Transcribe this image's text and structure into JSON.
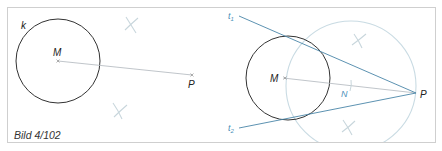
{
  "figure": {
    "caption": "Bild 4/102",
    "colors": {
      "frame": "#cfcfcf",
      "circle": "#333333",
      "helper_line": "#b9bec4",
      "tangent": "#4a86a8",
      "thales_circle": "#c9dbe3",
      "construction_marks": "#c8d6dc",
      "label": "#222222",
      "blue_label": "#4a90b8"
    },
    "left_panel": {
      "circle_label": "k",
      "center_label": "M",
      "point_label": "P"
    },
    "right_panel": {
      "center_label": "M",
      "point_label": "P",
      "midpoint_label": "N",
      "tangent1_label": "t",
      "tangent1_sub": "1",
      "tangent2_label": "t",
      "tangent2_sub": "2"
    }
  }
}
